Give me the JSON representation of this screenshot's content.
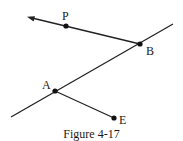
{
  "figure": {
    "caption": "Figure 4-17",
    "line_color": "#222222",
    "points": [
      {
        "id": "P",
        "label": "P",
        "x": 66,
        "y": 26,
        "label_x": 62,
        "label_y": 20
      },
      {
        "id": "B",
        "label": "B",
        "x": 140,
        "y": 44,
        "label_x": 146,
        "label_y": 55
      },
      {
        "id": "A",
        "label": "A",
        "x": 55,
        "y": 91,
        "label_x": 42,
        "label_y": 89
      },
      {
        "id": "E",
        "label": "E",
        "x": 114,
        "y": 118,
        "label_x": 119,
        "label_y": 124
      }
    ],
    "segments": [
      {
        "id": "ray-BP",
        "from": [
          140,
          44
        ],
        "to": [
          28,
          17
        ],
        "arrow_at_end": true
      },
      {
        "id": "line-AB",
        "from": [
          11,
          117
        ],
        "to": [
          173,
          24
        ],
        "arrow_at_end": false
      },
      {
        "id": "segment-AE",
        "from": [
          55,
          91
        ],
        "to": [
          114,
          118
        ],
        "arrow_at_end": false
      }
    ]
  }
}
